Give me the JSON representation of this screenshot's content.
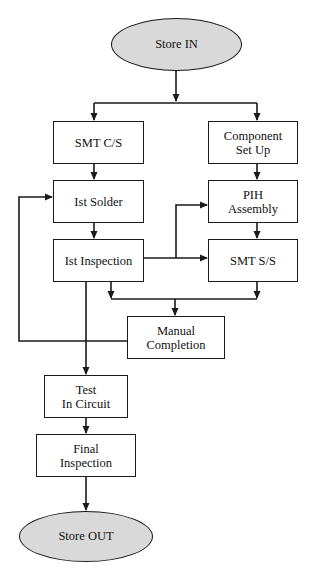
{
  "diagram": {
    "type": "flowchart",
    "title": "",
    "colors": {
      "line": "#1a1a1a",
      "terminal_fill": "#d9d9d9",
      "process_fill": "#ffffff"
    },
    "nodes": {
      "store_in": {
        "label": "Store IN",
        "shape": "ellipse"
      },
      "smt_cs": {
        "label": "SMT C/S",
        "shape": "rect"
      },
      "component_setup": {
        "label": "Component\nSet Up",
        "shape": "rect"
      },
      "first_solder": {
        "label": "Ist Solder",
        "shape": "rect"
      },
      "pih_assembly": {
        "label": "PIH\nAssembly",
        "shape": "rect"
      },
      "first_inspection": {
        "label": "Ist Inspection",
        "shape": "rect"
      },
      "smt_ss": {
        "label": "SMT S/S",
        "shape": "rect"
      },
      "manual_completion": {
        "label": "Manual\nCompletion",
        "shape": "rect"
      },
      "test_in_circuit": {
        "label": "Test\nIn Circuit",
        "shape": "rect"
      },
      "final_inspection": {
        "label": "Final\nInspection",
        "shape": "rect"
      },
      "store_out": {
        "label": "Store OUT",
        "shape": "ellipse"
      }
    },
    "edges": [
      {
        "from": "Store IN",
        "to": "SMT C/S"
      },
      {
        "from": "Store IN",
        "to": "Component Set Up"
      },
      {
        "from": "SMT C/S",
        "to": "Ist Solder"
      },
      {
        "from": "Component Set Up",
        "to": "PIH Assembly"
      },
      {
        "from": "Ist Solder",
        "to": "Ist Inspection"
      },
      {
        "from": "Ist Inspection",
        "to": "PIH Assembly"
      },
      {
        "from": "Ist Inspection",
        "to": "SMT S/S"
      },
      {
        "from": "PIH Assembly",
        "to": "SMT S/S"
      },
      {
        "from": "Ist Inspection",
        "to": "Manual Completion"
      },
      {
        "from": "SMT S/S",
        "to": "Manual Completion"
      },
      {
        "from": "Manual Completion",
        "to": "Ist Solder"
      },
      {
        "from": "Ist Inspection",
        "to": "Test In Circuit"
      },
      {
        "from": "Test In Circuit",
        "to": "Final Inspection"
      },
      {
        "from": "Final Inspection",
        "to": "Store OUT"
      }
    ]
  }
}
